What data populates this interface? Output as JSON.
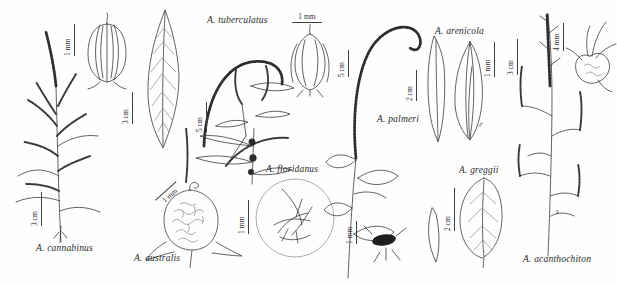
{
  "plate": {
    "background": "#fefefe",
    "ink_color": "#3b3b3b",
    "description": "Botanical line-drawing plate of Amaranthus species",
    "species_labels": [
      {
        "id": "cannabinus",
        "text": "A. cannabinus"
      },
      {
        "id": "australis",
        "text": "A. australis"
      },
      {
        "id": "tuberculatus",
        "text": "A. tuberculatus"
      },
      {
        "id": "floridanus",
        "text": "A. floridanus"
      },
      {
        "id": "palmeri",
        "text": "A. palmeri"
      },
      {
        "id": "arenicola",
        "text": "A. arenicola"
      },
      {
        "id": "greggii",
        "text": "A. greggii"
      },
      {
        "id": "acanthochiton",
        "text": "A. acanthochiton"
      }
    ],
    "scale_bars": [
      {
        "id": "cannabinus-utricle",
        "label": "1 mm"
      },
      {
        "id": "cannabinus-plant",
        "label": "3 cm"
      },
      {
        "id": "australis-leaf",
        "label": "3 cm"
      },
      {
        "id": "tuberculatus-plant",
        "label": "5 cm"
      },
      {
        "id": "tuberculatus-utricle",
        "label": "1 mm"
      },
      {
        "id": "australis-capsule",
        "label": "1 mm"
      },
      {
        "id": "floridanus-detail",
        "label": "1 mm"
      },
      {
        "id": "palmeri-plant",
        "label": "5 cm"
      },
      {
        "id": "palmeri-leaf",
        "label": "2 cm"
      },
      {
        "id": "palmeri-flower",
        "label": "1 mm"
      },
      {
        "id": "arenicola-bud",
        "label": "1 mm"
      },
      {
        "id": "acanthochiton-plant",
        "label": "3 cm"
      },
      {
        "id": "acanthochiton-fruit",
        "label": "4 mm"
      },
      {
        "id": "greggii-leaf",
        "label": "2 cm"
      }
    ],
    "symbols": {
      "male": "♂",
      "female": "♀"
    }
  }
}
